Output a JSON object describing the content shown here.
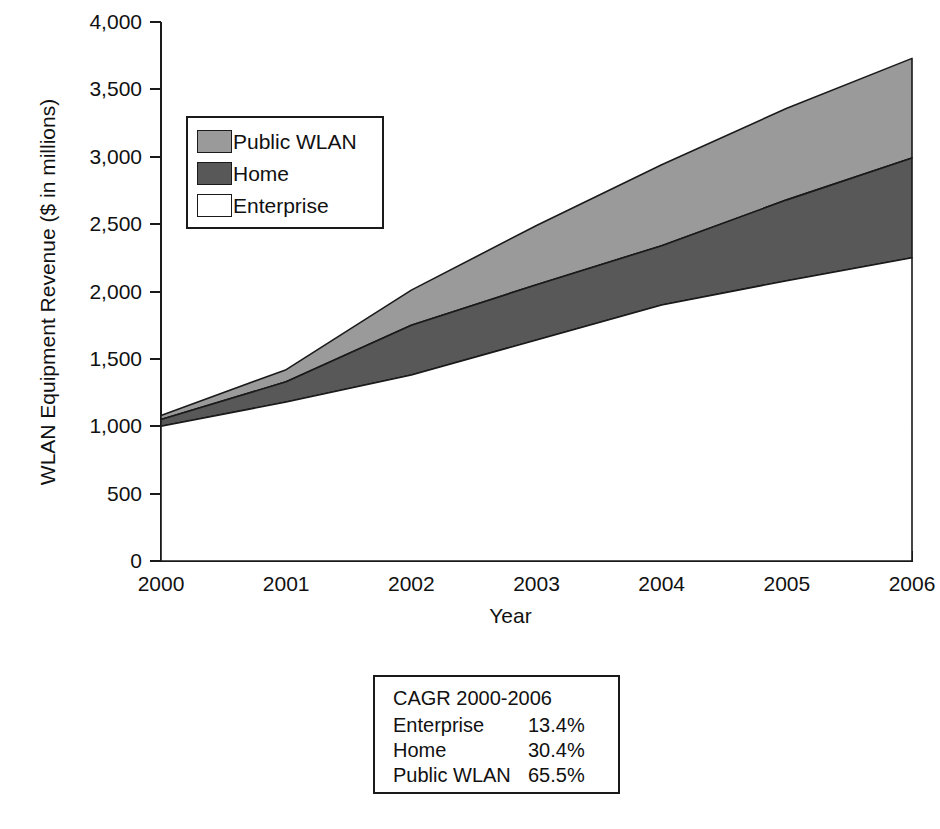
{
  "chart_data": {
    "type": "area",
    "stacked": true,
    "title": "",
    "xlabel": "Year",
    "ylabel": "WLAN Equipment Revenue ($ in millions)",
    "categories": [
      "2000",
      "2001",
      "2002",
      "2003",
      "2004",
      "2005",
      "2006"
    ],
    "x": [
      2000,
      2001,
      2002,
      2003,
      2004,
      2005,
      2006
    ],
    "xlim": [
      2000,
      2006
    ],
    "ylim": [
      0,
      4000
    ],
    "yticks": [
      0,
      500,
      1000,
      1500,
      2000,
      2500,
      3000,
      3500,
      4000
    ],
    "ytick_labels": [
      "0",
      "500",
      "1,000",
      "1,500",
      "2,000",
      "2,500",
      "3,000",
      "3,500",
      "4,000"
    ],
    "grid": false,
    "legend_position": "upper-left-inside",
    "series": [
      {
        "name": "Enterprise",
        "color": "#ffffff",
        "values": [
          1000,
          1180,
          1380,
          1640,
          1900,
          2080,
          2250
        ]
      },
      {
        "name": "Home",
        "color": "#585858",
        "values": [
          50,
          150,
          370,
          410,
          440,
          600,
          740
        ]
      },
      {
        "name": "Public WLAN",
        "color": "#9a9a9a",
        "values": [
          30,
          90,
          260,
          440,
          600,
          680,
          740
        ]
      }
    ],
    "cumulative_tops": {
      "Enterprise": [
        1000,
        1180,
        1380,
        1640,
        1900,
        2080,
        2250
      ],
      "Home": [
        1050,
        1330,
        1750,
        2050,
        2340,
        2680,
        2990
      ],
      "Public WLAN": [
        1080,
        1420,
        2010,
        2490,
        2940,
        3360,
        3730
      ]
    }
  },
  "axes": {
    "y_title": "WLAN Equipment Revenue ($ in millions)",
    "x_title": "Year",
    "y_tick_labels": [
      "4,000",
      "3,500",
      "3,000",
      "2,500",
      "2,000",
      "1,500",
      "1,000",
      "500",
      "0"
    ],
    "x_tick_labels": [
      "2000",
      "2001",
      "2002",
      "2003",
      "2004",
      "2005",
      "2006"
    ]
  },
  "legend": {
    "items": [
      {
        "label": "Public WLAN",
        "color": "#9a9a9a"
      },
      {
        "label": "Home",
        "color": "#585858"
      },
      {
        "label": "Enterprise",
        "color": "#ffffff"
      }
    ]
  },
  "cagr_table": {
    "title": "CAGR 2000-2006",
    "rows": [
      {
        "name": "Enterprise",
        "value": "13.4%"
      },
      {
        "name": "Home",
        "value": "30.4%"
      },
      {
        "name": "Public WLAN",
        "value": "65.5%"
      }
    ]
  }
}
